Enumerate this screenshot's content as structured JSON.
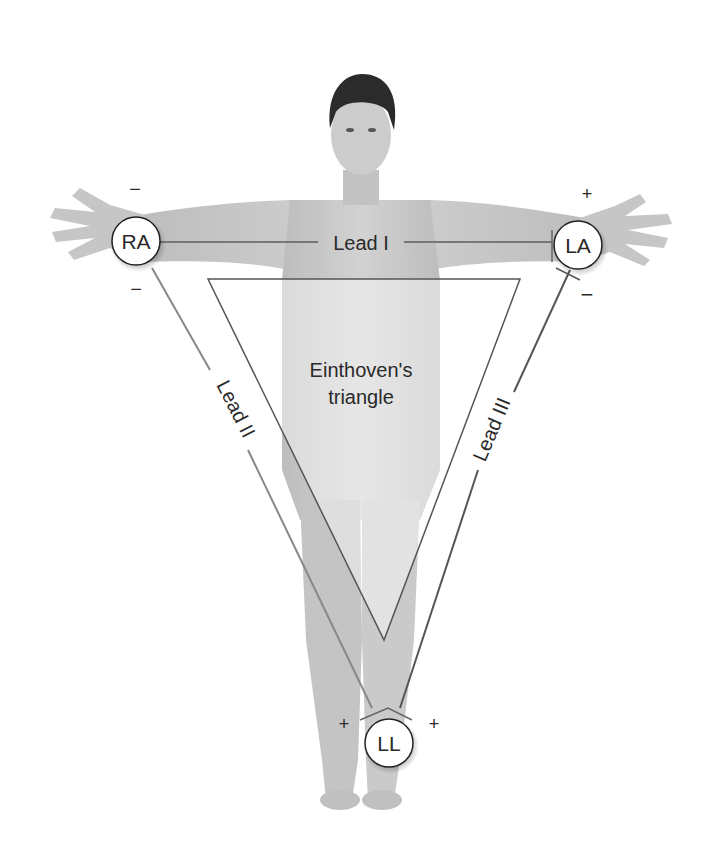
{
  "diagram": {
    "center_label_line1": "Einthoven's",
    "center_label_line2": "triangle",
    "electrodes": {
      "ra": "RA",
      "la": "LA",
      "ll": "LL"
    },
    "leads": {
      "lead1": "Lead I",
      "lead2": "Lead II",
      "lead3": "Lead III"
    },
    "polarity": {
      "ra_lead1": "−",
      "ra_lead2": "−",
      "la_lead1": "+",
      "la_lead3": "−",
      "ll_lead2": "+",
      "ll_lead3": "+"
    },
    "colors": {
      "skin": "#c9c9c9",
      "hair": "#2b2b2b",
      "line": "#6a6a6a",
      "electrode_fill": "#ffffff",
      "electrode_stroke": "#222222"
    }
  }
}
